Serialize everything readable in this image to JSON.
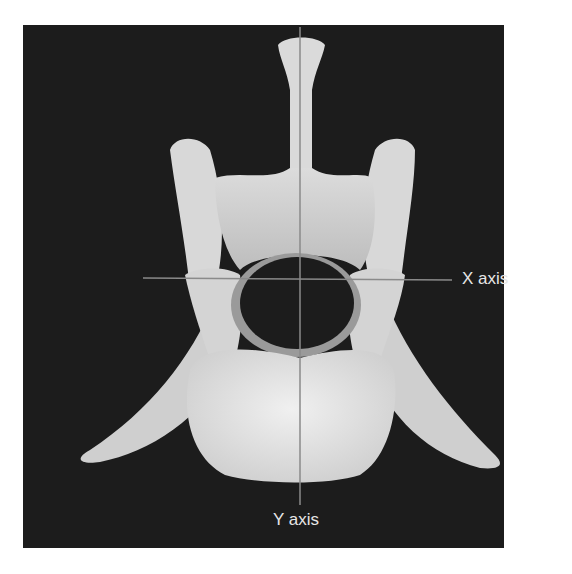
{
  "figure": {
    "labels": {
      "x_axis": "X axis",
      "y_axis": "Y axis"
    },
    "colors": {
      "background": "#1c1c1c",
      "bone": "#d9d9d9",
      "axis_line": "#8a8a8a",
      "label": "#e6e6e6"
    }
  }
}
